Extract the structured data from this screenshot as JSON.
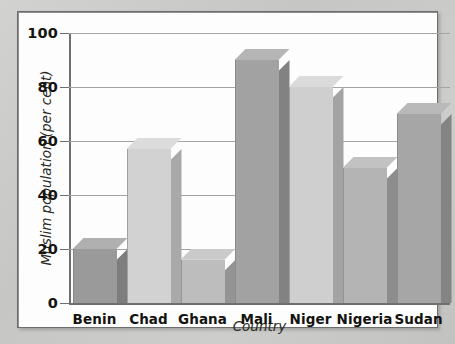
{
  "chart_data": {
    "type": "bar",
    "title": "",
    "xlabel": "Country",
    "ylabel": "Muslim population (per cent)",
    "categories": [
      "Benin",
      "Chad",
      "Ghana",
      "Mali",
      "Niger",
      "Nigeria",
      "Sudan"
    ],
    "values": [
      20,
      57,
      16,
      90,
      80,
      50,
      70
    ],
    "ylim": [
      0,
      100
    ],
    "yticks": [
      0,
      20,
      40,
      60,
      80,
      100
    ],
    "ytick_labels": [
      "0",
      "20",
      "40",
      "60",
      "80",
      "100"
    ],
    "grid": "horizontal",
    "legend": "none",
    "series": [
      {
        "name": "Muslim population (per cent)",
        "values": [
          20,
          57,
          16,
          90,
          80,
          50,
          70
        ]
      }
    ],
    "bar_style": "3d-extruded",
    "bar_colors": [
      "#9a9a9a",
      "#d2d2d2",
      "#bdbdbd",
      "#a2a2a2",
      "#cfcfcf",
      "#b4b4b4",
      "#a6a6a6"
    ],
    "bar_side_colors": [
      "#7d7d7d",
      "#a9a9a9",
      "#949494",
      "#828282",
      "#a3a3a3",
      "#8d8d8d",
      "#848484"
    ],
    "bar_top_colors": [
      "#b0b0b0",
      "#dcdcdc",
      "#cacaca",
      "#b5b5b5",
      "#dadada",
      "#c2c2c2",
      "#b9b9b9"
    ]
  },
  "colors": {
    "mat": "#c9c9c7",
    "plot_background": "#fdfdfd",
    "frame_border": "#6d6d6d",
    "gridline": "#a4a4a4",
    "axis": "#6f6f6f",
    "text": "#15140f"
  }
}
